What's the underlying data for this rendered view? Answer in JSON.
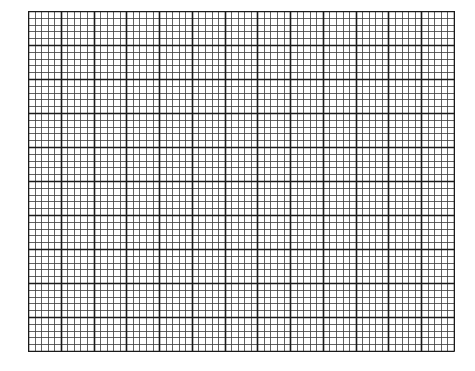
{
  "grid": {
    "major_columns": 13,
    "major_rows": 10,
    "subdivisions": 5,
    "width": 426,
    "height": 340,
    "colors": {
      "background": "#ffffff",
      "major_line": "#1a1a1a",
      "minor_line": "#3a3a3a"
    }
  }
}
